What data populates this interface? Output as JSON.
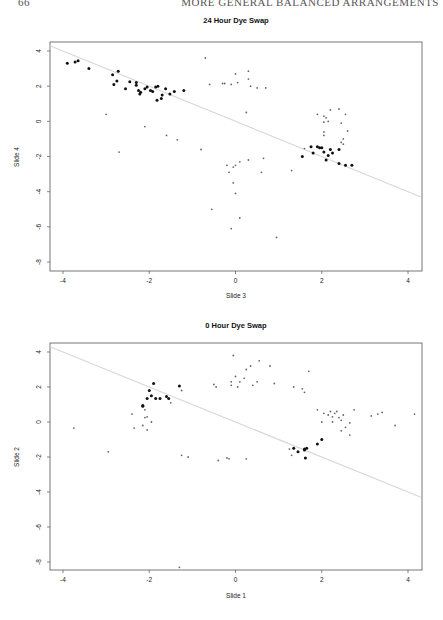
{
  "page": {
    "page_number": "66",
    "running_head": "MORE GENERAL BALANCED ARRANGEMENTS"
  },
  "chart_data": [
    {
      "type": "scatter",
      "title": "24 Hour Dye Swap",
      "xlabel": "Slide 3",
      "ylabel": "Slide 4",
      "xlim": [
        -4.3,
        4.3
      ],
      "ylim": [
        -8.5,
        4.5
      ],
      "xticks": [
        -4,
        -2,
        0,
        2,
        4
      ],
      "yticks": [
        4,
        2,
        0,
        -2,
        -4,
        -6,
        -8
      ],
      "grid": false,
      "reference_line": {
        "slope": -1,
        "intercept": 0,
        "color": "#d8d8d8"
      },
      "series": [
        {
          "name": "highlighted",
          "style": "bold",
          "points": [
            [
              -3.9,
              3.3
            ],
            [
              -3.72,
              3.38
            ],
            [
              -3.65,
              3.45
            ],
            [
              -3.4,
              3.0
            ],
            [
              -2.85,
              2.65
            ],
            [
              -2.72,
              2.85
            ],
            [
              -2.82,
              2.1
            ],
            [
              -2.75,
              2.3
            ],
            [
              -2.55,
              1.85
            ],
            [
              -2.45,
              2.25
            ],
            [
              -2.3,
              2.2
            ],
            [
              -2.3,
              2.05
            ],
            [
              -2.25,
              1.75
            ],
            [
              -2.22,
              1.55
            ],
            [
              -2.2,
              1.65
            ],
            [
              -2.1,
              1.85
            ],
            [
              -2.05,
              1.95
            ],
            [
              -1.97,
              1.75
            ],
            [
              -1.92,
              1.7
            ],
            [
              -1.85,
              1.95
            ],
            [
              -1.8,
              2.0
            ],
            [
              -1.82,
              1.2
            ],
            [
              -1.7,
              1.5
            ],
            [
              -1.72,
              1.3
            ],
            [
              -1.62,
              1.85
            ],
            [
              -1.52,
              1.55
            ],
            [
              -1.42,
              1.7
            ],
            [
              -1.2,
              1.75
            ],
            [
              1.55,
              -2.0
            ],
            [
              1.75,
              -1.45
            ],
            [
              1.8,
              -1.8
            ],
            [
              1.9,
              -1.45
            ],
            [
              1.95,
              -1.5
            ],
            [
              2.0,
              -1.5
            ],
            [
              2.05,
              -1.75
            ],
            [
              2.1,
              -2.2
            ],
            [
              2.15,
              -1.95
            ],
            [
              2.2,
              -1.6
            ],
            [
              2.25,
              -1.8
            ],
            [
              2.4,
              -1.6
            ],
            [
              2.4,
              -2.4
            ],
            [
              2.55,
              -2.5
            ],
            [
              2.7,
              -2.5
            ]
          ]
        },
        {
          "name": "other",
          "style": "light",
          "points": [
            [
              -3.0,
              0.4
            ],
            [
              -2.7,
              -1.75
            ],
            [
              -2.1,
              -0.3
            ],
            [
              -1.6,
              -0.8
            ],
            [
              -1.35,
              -1.05
            ],
            [
              -0.8,
              -1.6
            ],
            [
              -0.7,
              3.6
            ],
            [
              -0.6,
              2.1
            ],
            [
              -0.3,
              2.15
            ],
            [
              -0.25,
              2.15
            ],
            [
              0.0,
              2.7
            ],
            [
              0.05,
              2.2
            ],
            [
              0.3,
              2.85
            ],
            [
              0.3,
              2.4
            ],
            [
              0.35,
              2.0
            ],
            [
              0.5,
              1.9
            ],
            [
              0.7,
              1.9
            ],
            [
              -0.1,
              2.1
            ],
            [
              0.25,
              0.5
            ],
            [
              -0.2,
              -2.5
            ],
            [
              -0.15,
              -2.9
            ],
            [
              -0.05,
              -3.5
            ],
            [
              0.0,
              -2.5
            ],
            [
              -0.05,
              -2.6
            ],
            [
              0.1,
              -2.3
            ],
            [
              0.3,
              -2.2
            ],
            [
              0.65,
              -2.1
            ],
            [
              0.6,
              -2.9
            ],
            [
              -0.55,
              -5.0
            ],
            [
              0.1,
              -5.5
            ],
            [
              -0.1,
              -6.1
            ],
            [
              0.0,
              -4.1
            ],
            [
              0.95,
              -6.6
            ],
            [
              1.3,
              -2.8
            ],
            [
              1.6,
              -1.55
            ],
            [
              1.9,
              0.4
            ],
            [
              2.05,
              0.3
            ],
            [
              2.05,
              -0.05
            ],
            [
              2.1,
              0.2
            ],
            [
              2.05,
              -0.6
            ],
            [
              2.05,
              -0.8
            ],
            [
              2.15,
              0.0
            ],
            [
              2.2,
              0.65
            ],
            [
              2.4,
              0.7
            ],
            [
              2.55,
              0.4
            ],
            [
              2.45,
              -0.1
            ],
            [
              2.6,
              -0.55
            ],
            [
              2.5,
              -1.0
            ],
            [
              2.5,
              -1.3
            ],
            [
              2.45,
              -1.2
            ]
          ]
        }
      ]
    },
    {
      "type": "scatter",
      "title": "0 Hour Dye Swap",
      "xlabel": "Slide 1",
      "ylabel": "Slide 2",
      "xlim": [
        -4.3,
        4.3
      ],
      "ylim": [
        -8.5,
        4.5
      ],
      "xticks": [
        -4,
        -2,
        0,
        2,
        4
      ],
      "yticks": [
        4,
        2,
        0,
        -2,
        -4,
        -6,
        -8
      ],
      "grid": false,
      "reference_line": {
        "slope": -1,
        "intercept": 0,
        "color": "#d8d8d8"
      },
      "series": [
        {
          "name": "highlighted",
          "style": "bold",
          "points": [
            [
              -2.05,
              1.35
            ],
            [
              -2.0,
              1.8
            ],
            [
              -1.95,
              1.5
            ],
            [
              -1.9,
              2.2
            ],
            [
              -1.85,
              1.35
            ],
            [
              -1.75,
              1.35
            ],
            [
              -1.6,
              1.45
            ],
            [
              -1.55,
              1.35
            ],
            [
              -1.3,
              2.05
            ],
            [
              -2.15,
              0.95
            ],
            [
              -2.15,
              0.9
            ],
            [
              1.35,
              -1.5
            ],
            [
              1.45,
              -1.7
            ],
            [
              1.6,
              -1.6
            ],
            [
              1.6,
              -1.55
            ],
            [
              1.65,
              -1.5
            ],
            [
              1.62,
              -2.05
            ],
            [
              1.9,
              -1.25
            ],
            [
              2.0,
              -1.0
            ]
          ]
        },
        {
          "name": "other",
          "style": "light",
          "points": [
            [
              -3.75,
              -0.35
            ],
            [
              -2.95,
              -1.7
            ],
            [
              -2.4,
              0.45
            ],
            [
              -2.35,
              -0.35
            ],
            [
              -2.15,
              -0.2
            ],
            [
              -2.1,
              0.25
            ],
            [
              -2.1,
              0.7
            ],
            [
              -2.05,
              0.3
            ],
            [
              -2.05,
              -0.45
            ],
            [
              -1.95,
              0.0
            ],
            [
              -1.5,
              1.1
            ],
            [
              -1.25,
              1.8
            ],
            [
              -1.1,
              -2.0
            ],
            [
              -1.25,
              -1.9
            ],
            [
              -0.5,
              2.15
            ],
            [
              -0.45,
              2.0
            ],
            [
              -0.1,
              2.3
            ],
            [
              -0.1,
              2.1
            ],
            [
              -0.05,
              3.8
            ],
            [
              0.05,
              2.0
            ],
            [
              0.0,
              2.6
            ],
            [
              0.1,
              2.3
            ],
            [
              0.2,
              2.5
            ],
            [
              0.25,
              3.0
            ],
            [
              0.35,
              3.2
            ],
            [
              0.4,
              2.1
            ],
            [
              0.5,
              2.3
            ],
            [
              0.55,
              3.5
            ],
            [
              0.8,
              3.2
            ],
            [
              0.9,
              2.2
            ],
            [
              1.6,
              1.7
            ],
            [
              1.7,
              2.9
            ],
            [
              1.35,
              2.0
            ],
            [
              1.55,
              1.9
            ],
            [
              1.25,
              -1.55
            ],
            [
              1.3,
              -1.9
            ],
            [
              -1.3,
              -8.3
            ],
            [
              -0.4,
              -2.2
            ],
            [
              -0.15,
              -2.1
            ],
            [
              -0.2,
              -2.05
            ],
            [
              0.25,
              -2.1
            ],
            [
              1.9,
              0.7
            ],
            [
              2.0,
              0.0
            ],
            [
              2.05,
              0.5
            ],
            [
              2.15,
              0.4
            ],
            [
              2.2,
              0.6
            ],
            [
              2.25,
              0.3
            ],
            [
              2.25,
              0.0
            ],
            [
              2.3,
              0.5
            ],
            [
              2.35,
              0.6
            ],
            [
              2.4,
              0.25
            ],
            [
              2.45,
              0.1
            ],
            [
              2.5,
              0.4
            ],
            [
              2.55,
              -0.3
            ],
            [
              2.65,
              -0.05
            ],
            [
              2.75,
              0.7
            ],
            [
              2.65,
              -0.75
            ],
            [
              2.45,
              -0.5
            ],
            [
              3.15,
              0.35
            ],
            [
              3.3,
              0.45
            ],
            [
              3.4,
              0.55
            ],
            [
              3.7,
              -0.2
            ],
            [
              4.15,
              0.45
            ]
          ]
        }
      ]
    }
  ]
}
